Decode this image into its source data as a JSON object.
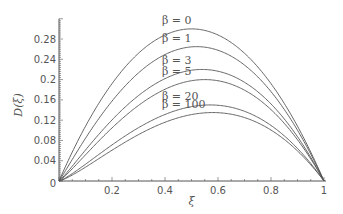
{
  "chart_data": {
    "type": "line",
    "title": "",
    "xlabel": "ξ",
    "ylabel": "D(ξ)",
    "xlim": [
      0,
      1
    ],
    "ylim": [
      0,
      0.31
    ],
    "grid": false,
    "legend_position": "inline labels above curves",
    "x_ticks": [
      "0.2",
      "0.4",
      "0.6",
      "0.8",
      "1"
    ],
    "y_ticks": [
      "0.04",
      "0.08",
      "0.12",
      "0.16",
      "0.2",
      "0.24",
      "0.28"
    ],
    "origin_label": "0",
    "x": [
      0,
      0.1,
      0.2,
      0.3,
      0.4,
      0.5,
      0.6,
      0.7,
      0.8,
      0.9,
      1.0
    ],
    "series": [
      {
        "name": "β=0",
        "label": "β = 0",
        "peak_x": 0.5,
        "peak_y": 0.3,
        "values": [
          0,
          0.108,
          0.192,
          0.252,
          0.288,
          0.3,
          0.288,
          0.252,
          0.192,
          0.108,
          0
        ]
      },
      {
        "name": "β=1",
        "label": "β = 1",
        "peak_x": 0.52,
        "peak_y": 0.265,
        "values": [
          0,
          0.088,
          0.162,
          0.218,
          0.252,
          0.264,
          0.256,
          0.226,
          0.174,
          0.099,
          0
        ]
      },
      {
        "name": "β=3",
        "label": "β = 3",
        "peak_x": 0.54,
        "peak_y": 0.22,
        "values": [
          0,
          0.066,
          0.126,
          0.174,
          0.206,
          0.219,
          0.215,
          0.192,
          0.15,
          0.087,
          0
        ]
      },
      {
        "name": "β=5",
        "label": "β = 5",
        "peak_x": 0.55,
        "peak_y": 0.2,
        "values": [
          0,
          0.057,
          0.111,
          0.155,
          0.186,
          0.199,
          0.197,
          0.177,
          0.139,
          0.081,
          0
        ]
      },
      {
        "name": "β=20",
        "label": "β = 20",
        "peak_x": 0.57,
        "peak_y": 0.15,
        "values": [
          0,
          0.038,
          0.077,
          0.112,
          0.136,
          0.148,
          0.15,
          0.137,
          0.109,
          0.065,
          0
        ]
      },
      {
        "name": "β=100",
        "label": "β = 100",
        "peak_x": 0.58,
        "peak_y": 0.135,
        "values": [
          0,
          0.032,
          0.066,
          0.098,
          0.121,
          0.133,
          0.135,
          0.125,
          0.1,
          0.06,
          0
        ]
      }
    ]
  },
  "colors": {
    "curve": "#555555",
    "axis": "#555555",
    "text": "#555555",
    "background": "#ffffff"
  }
}
